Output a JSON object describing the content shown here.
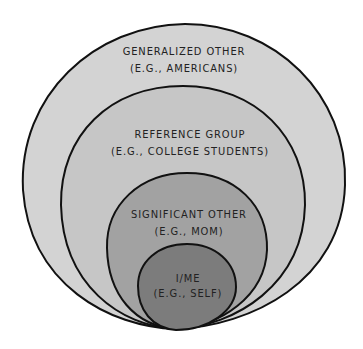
{
  "diagram": {
    "type": "nested-circles",
    "colors": {
      "outer": "#d3d3d3",
      "reference": "#c4c4c4",
      "significant": "#9e9e9e",
      "self": "#7a7a7a",
      "stroke": "#111111"
    },
    "layers": [
      {
        "title": "GENERALIZED OTHER",
        "example": "(E.G., AMERICANS)"
      },
      {
        "title": "REFERENCE GROUP",
        "example": "(E.G., COLLEGE STUDENTS)"
      },
      {
        "title": "SIGNIFICANT OTHER",
        "example": "(E.G., MOM)"
      },
      {
        "title": "I/ME",
        "example": "(E.G., SELF)"
      }
    ]
  }
}
